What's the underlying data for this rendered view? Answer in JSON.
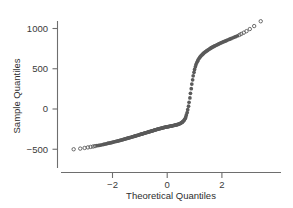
{
  "chart_data": {
    "type": "scatter",
    "title": "",
    "subtitle": "",
    "xlabel": "Theoretical Quantiles",
    "ylabel": "Sample Quantiles",
    "xlim": [
      -3.75,
      3.75
    ],
    "ylim": [
      -620,
      1160
    ],
    "xticks": [
      -2,
      0,
      2
    ],
    "xticklabels": [
      "−2",
      "0",
      "2"
    ],
    "yticks": [
      -500,
      0,
      500,
      1000
    ],
    "yticklabels": [
      "−500",
      "0",
      "500",
      "1000"
    ],
    "grid": false,
    "legend": null,
    "marker": "open-circle",
    "marker_color": "#5a5a5a",
    "annotations": [],
    "x": [
      -3.42,
      -3.18,
      -3.02,
      -2.9,
      -2.8,
      -2.71,
      -2.64,
      -2.57,
      -2.5,
      -2.44,
      -2.38,
      -2.33,
      -2.28,
      -2.23,
      -2.18,
      -2.14,
      -2.09,
      -2.05,
      -2.01,
      -1.97,
      -1.93,
      -1.89,
      -1.86,
      -1.82,
      -1.79,
      -1.75,
      -1.72,
      -1.69,
      -1.65,
      -1.62,
      -1.59,
      -1.56,
      -1.53,
      -1.5,
      -1.47,
      -1.44,
      -1.41,
      -1.38,
      -1.35,
      -1.32,
      -1.3,
      -1.27,
      -1.24,
      -1.21,
      -1.19,
      -1.16,
      -1.13,
      -1.11,
      -1.08,
      -1.05,
      -1.03,
      -1.0,
      -0.98,
      -0.95,
      -0.93,
      -0.9,
      -0.88,
      -0.85,
      -0.83,
      -0.8,
      -0.78,
      -0.75,
      -0.73,
      -0.7,
      -0.68,
      -0.66,
      -0.63,
      -0.61,
      -0.58,
      -0.56,
      -0.54,
      -0.51,
      -0.49,
      -0.47,
      -0.44,
      -0.42,
      -0.4,
      -0.37,
      -0.35,
      -0.33,
      -0.3,
      -0.28,
      -0.26,
      -0.23,
      -0.21,
      -0.19,
      -0.16,
      -0.14,
      -0.12,
      -0.1,
      -0.07,
      -0.05,
      -0.03,
      0.0,
      0.03,
      0.05,
      0.07,
      0.1,
      0.12,
      0.14,
      0.16,
      0.19,
      0.21,
      0.23,
      0.26,
      0.28,
      0.3,
      0.33,
      0.35,
      0.37,
      0.4,
      0.42,
      0.44,
      0.47,
      0.49,
      0.51,
      0.54,
      0.56,
      0.58,
      0.61,
      0.63,
      0.66,
      0.68,
      0.7,
      0.73,
      0.75,
      0.78,
      0.8,
      0.83,
      0.85,
      0.88,
      0.9,
      0.93,
      0.95,
      0.98,
      1.0,
      1.03,
      1.05,
      1.08,
      1.11,
      1.13,
      1.16,
      1.19,
      1.21,
      1.24,
      1.27,
      1.3,
      1.32,
      1.35,
      1.38,
      1.41,
      1.44,
      1.47,
      1.5,
      1.53,
      1.56,
      1.59,
      1.62,
      1.65,
      1.69,
      1.72,
      1.75,
      1.79,
      1.82,
      1.86,
      1.89,
      1.93,
      1.97,
      2.01,
      2.05,
      2.09,
      2.14,
      2.18,
      2.23,
      2.28,
      2.33,
      2.38,
      2.44,
      2.5,
      2.57,
      2.64,
      2.71,
      2.8,
      2.9,
      3.02,
      3.18,
      3.42
    ],
    "y": [
      -500,
      -492,
      -484,
      -477,
      -471,
      -466,
      -461,
      -456,
      -452,
      -448,
      -444,
      -440,
      -436,
      -432,
      -428,
      -425,
      -421,
      -418,
      -414,
      -411,
      -407,
      -404,
      -401,
      -398,
      -395,
      -392,
      -389,
      -386,
      -383,
      -380,
      -377,
      -374,
      -371,
      -368,
      -365,
      -362,
      -359,
      -356,
      -354,
      -351,
      -348,
      -345,
      -342,
      -340,
      -337,
      -334,
      -331,
      -329,
      -326,
      -323,
      -321,
      -318,
      -315,
      -313,
      -310,
      -308,
      -305,
      -302,
      -300,
      -297,
      -295,
      -292,
      -290,
      -287,
      -285,
      -282,
      -280,
      -277,
      -275,
      -272,
      -270,
      -268,
      -265,
      -263,
      -260,
      -258,
      -256,
      -253,
      -251,
      -249,
      -246,
      -244,
      -242,
      -240,
      -238,
      -236,
      -234,
      -232,
      -230,
      -228,
      -226,
      -224,
      -223,
      -221,
      -219,
      -218,
      -216,
      -214,
      -213,
      -211,
      -210,
      -208,
      -206,
      -205,
      -203,
      -201,
      -199,
      -197,
      -195,
      -193,
      -190,
      -187,
      -184,
      -181,
      -177,
      -172,
      -167,
      -161,
      -153,
      -144,
      -132,
      -117,
      -98,
      -74,
      -44,
      -8,
      35,
      84,
      138,
      195,
      253,
      310,
      363,
      412,
      455,
      492,
      524,
      551,
      574,
      594,
      611,
      626,
      639,
      651,
      662,
      672,
      681,
      690,
      698,
      706,
      714,
      721,
      728,
      735,
      742,
      749,
      755,
      762,
      768,
      774,
      780,
      786,
      792,
      798,
      804,
      810,
      816,
      822,
      828,
      834,
      840,
      846,
      853,
      860,
      867,
      874,
      882,
      890,
      899,
      909,
      920,
      933,
      948,
      967,
      993,
      1030,
      1090
    ],
    "open_tail_count_low": 7,
    "open_tail_count_high": 7
  },
  "axes": {
    "x_title": "Theoretical Quantiles",
    "y_title": "Sample Quantiles",
    "x_tick_labels": [
      "−2",
      "0",
      "2"
    ],
    "y_tick_labels": [
      "1000",
      "500",
      "0",
      "−500"
    ]
  },
  "colors": {
    "marker": "#5a5a5a",
    "axis": "#6e6e6e",
    "text": "#2e2e2e",
    "background": "#ffffff"
  }
}
